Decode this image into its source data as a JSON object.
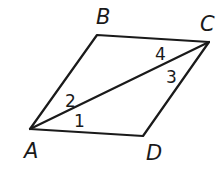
{
  "diagram": {
    "type": "parallelogram-with-diagonal",
    "vertices": [
      {
        "label": "A",
        "x": 30,
        "y": 129,
        "lx": 24,
        "ly": 158
      },
      {
        "label": "B",
        "x": 97,
        "y": 35,
        "lx": 96,
        "ly": 24
      },
      {
        "label": "C",
        "x": 209,
        "y": 42,
        "lx": 200,
        "ly": 31
      },
      {
        "label": "D",
        "x": 143,
        "y": 136,
        "lx": 146,
        "ly": 160
      }
    ],
    "edges": [
      [
        "A",
        "B"
      ],
      [
        "B",
        "C"
      ],
      [
        "C",
        "D"
      ],
      [
        "D",
        "A"
      ],
      [
        "A",
        "C"
      ]
    ],
    "angles": [
      {
        "label": "1",
        "x": 74,
        "y": 127
      },
      {
        "label": "2",
        "x": 65,
        "y": 107
      },
      {
        "label": "3",
        "x": 166,
        "y": 83
      },
      {
        "label": "4",
        "x": 155,
        "y": 60
      }
    ]
  }
}
